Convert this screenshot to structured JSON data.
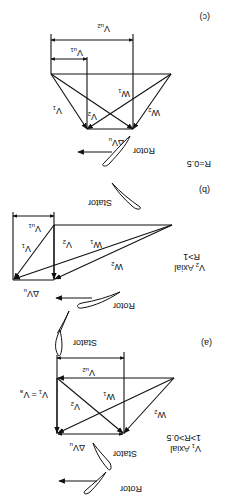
{
  "orientation": "rotated-180",
  "panels": {
    "a": {
      "label": "(a)",
      "condition_line1": "V1 Axial",
      "condition_line2": "1>R>0.5",
      "vectors": [
        "V1 = Va",
        "V2",
        "W1",
        "W2"
      ],
      "dims": [
        "Vu2",
        "ΔVu"
      ],
      "blades": [
        "Stator",
        "Rotor",
        "Stator"
      ]
    },
    "b": {
      "label": "(b)",
      "condition_line1": "V2 Axial",
      "condition_line2": "R>1",
      "vectors": [
        "V1",
        "V2",
        "W1",
        "W2"
      ],
      "dims": [
        "Vu1",
        "ΔVu"
      ],
      "blades": [
        "Rotor",
        "Stator"
      ]
    },
    "c": {
      "label": "(c)",
      "condition": "R=0.5",
      "vectors": [
        "V1",
        "V2",
        "W1",
        "W2"
      ],
      "dims": [
        "Vu1",
        "Vu2",
        "ΔVu"
      ],
      "blades": [
        "Rotor"
      ]
    }
  },
  "labels": {
    "a_label": "(a)",
    "b_label": "(b)",
    "c_label": "(c)",
    "a_cond1": "V",
    "a_cond1_sub": "1",
    "a_cond1_rest": " Axial",
    "a_cond2": "1>R>0.5",
    "b_cond1": "V",
    "b_cond1_sub": "2",
    "b_cond1_rest": " Axial",
    "b_cond2": "R>1",
    "c_cond": "R=0.5",
    "rotor": "Rotor",
    "stator": "Stator",
    "V": "V",
    "W": "W",
    "dV": "ΔV",
    "s1": "1",
    "s2": "2",
    "su": "u",
    "su1": "u1",
    "su2": "u2",
    "sa": "a",
    "eq": "="
  }
}
